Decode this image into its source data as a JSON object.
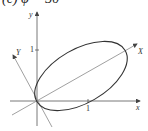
{
  "title": "(c) φ = 30°",
  "axes": {
    "x_label": "x",
    "y_label": "y",
    "x_tick_label": "1",
    "y_tick_label": "1",
    "rotated_x_label": "X",
    "rotated_y_label": "Y",
    "rotation_angle_deg": 30
  },
  "ellipse": {
    "description": "Ellipse passing through origin, major axis along rotated X axis",
    "semi_major_units": 1.0,
    "semi_minor_units": 0.55,
    "center_units": [
      0.87,
      0.5
    ]
  },
  "colors": {
    "axes": "#555555",
    "rotated_axes": "#777777",
    "curve": "#333333"
  }
}
